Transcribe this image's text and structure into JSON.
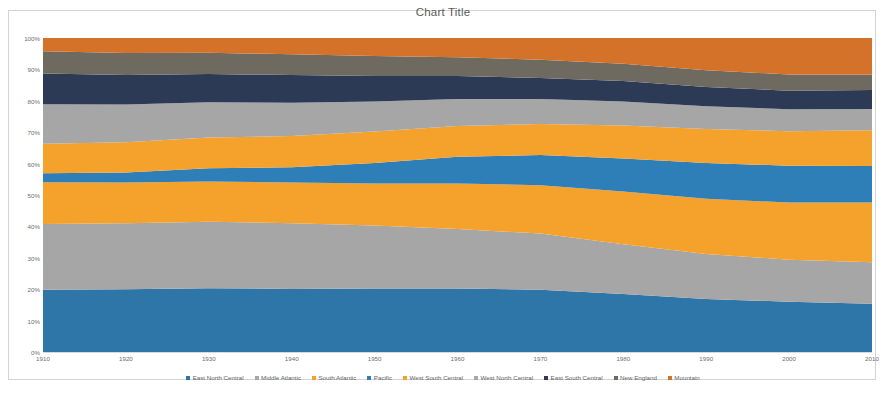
{
  "chart": {
    "title": "Chart Title",
    "y_ticks": [
      "100%",
      "90%",
      "80%",
      "70%",
      "60%",
      "50%",
      "40%",
      "30%",
      "20%",
      "10%",
      "0%"
    ],
    "x_ticks": [
      "1910",
      "1920",
      "1930",
      "1940",
      "1950",
      "1960",
      "1970",
      "1980",
      "1990",
      "2000",
      "2010"
    ]
  },
  "legend": {
    "items": [
      {
        "label": "East North Central",
        "color": "#2E75A8"
      },
      {
        "label": "Middle Atlantic",
        "color": "#A6A6A6"
      },
      {
        "label": "South Atlantic",
        "color": "#F5A22D"
      },
      {
        "label": "Pacific",
        "color": "#2E7EB8"
      },
      {
        "label": "West South Central",
        "color": "#F5A22D"
      },
      {
        "label": "West North Central",
        "color": "#A6A6A6"
      },
      {
        "label": "East South Central",
        "color": "#2C3A56"
      },
      {
        "label": "New England",
        "color": "#6E6A60"
      },
      {
        "label": "Mountain",
        "color": "#D4722A"
      }
    ]
  },
  "chart_data": {
    "type": "area",
    "stacked": "percent",
    "title": "Chart Title",
    "xlabel": "",
    "ylabel": "",
    "ylim": [
      0,
      100
    ],
    "grid": false,
    "legend_position": "bottom",
    "x": [
      1910,
      1920,
      1930,
      1940,
      1950,
      1960,
      1970,
      1980,
      1990,
      2000,
      2010
    ],
    "series": [
      {
        "name": "East North Central",
        "color": "#2E75A8",
        "values": [
          19.8,
          20.0,
          20.3,
          20.1,
          20.2,
          20.2,
          19.8,
          18.5,
          16.9,
          16.0,
          15.4
        ]
      },
      {
        "name": "Middle Atlantic",
        "color": "#A6A6A6",
        "values": [
          21.0,
          21.0,
          21.2,
          20.9,
          20.1,
          19.0,
          17.9,
          15.8,
          14.3,
          13.4,
          13.2
        ]
      },
      {
        "name": "South Atlantic",
        "color": "#F5A22D",
        "values": [
          13.3,
          13.0,
          12.8,
          13.0,
          13.4,
          14.5,
          15.4,
          16.8,
          17.6,
          18.2,
          19.0
        ]
      },
      {
        "name": "Pacific",
        "color": "#2E7EB8",
        "values": [
          2.8,
          3.2,
          4.2,
          4.8,
          6.5,
          8.5,
          9.6,
          10.5,
          11.4,
          11.7,
          11.6
        ]
      },
      {
        "name": "West South Central",
        "color": "#F5A22D",
        "values": [
          9.4,
          9.6,
          9.8,
          10.0,
          10.0,
          9.8,
          9.9,
          10.5,
          10.8,
          11.0,
          11.4
        ]
      },
      {
        "name": "West North Central",
        "color": "#A6A6A6",
        "values": [
          12.6,
          12.0,
          11.2,
          10.6,
          9.6,
          8.6,
          8.0,
          7.7,
          7.3,
          7.0,
          6.8
        ]
      },
      {
        "name": "East South Central",
        "color": "#2C3A56",
        "values": [
          9.8,
          9.4,
          9.0,
          8.8,
          8.1,
          7.3,
          6.7,
          6.5,
          6.1,
          5.9,
          6.0
        ]
      },
      {
        "name": "New England",
        "color": "#6E6A60",
        "values": [
          7.1,
          7.0,
          6.8,
          6.6,
          6.4,
          6.0,
          5.8,
          5.5,
          5.3,
          5.2,
          5.0
        ]
      },
      {
        "name": "Mountain",
        "color": "#D4722A",
        "values": [
          4.2,
          4.8,
          4.7,
          5.2,
          5.7,
          6.1,
          6.9,
          8.2,
          10.3,
          11.6,
          11.6
        ]
      }
    ]
  }
}
